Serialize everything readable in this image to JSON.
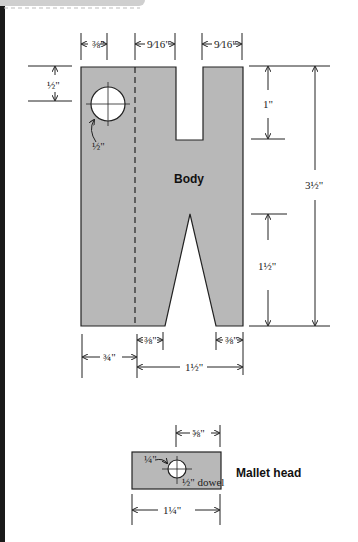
{
  "colors": {
    "stock_fill": "#b8b8b8",
    "line": "#222222",
    "background": "#ffffff"
  },
  "body": {
    "label": "Body",
    "dims": {
      "top_left": "⅜\"",
      "top_mid": "9⁄16\"",
      "top_right": "9⁄16\"",
      "hole_offset": "½\"",
      "hole_diameter": "½\"",
      "slot_depth": "1\"",
      "overall_height": "3½\"",
      "vee_height": "1½\"",
      "bottom_left_foot": "⅜\"",
      "bottom_right_foot": "⅜\"",
      "bottom_left": "¾\"",
      "bottom_right": "1½\""
    }
  },
  "head": {
    "label": "Mallet head",
    "dims": {
      "top": "⅝\"",
      "hole_offset": "¼\"",
      "dowel": "½\" dowel",
      "width": "1¼\""
    }
  }
}
